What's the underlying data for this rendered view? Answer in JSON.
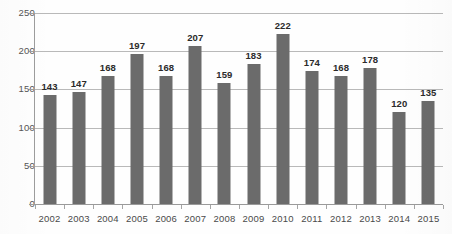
{
  "chart_data": {
    "type": "bar",
    "title": "",
    "xlabel": "",
    "ylabel": "",
    "categories": [
      "2002",
      "2003",
      "2004",
      "2005",
      "2006",
      "2007",
      "2008",
      "2009",
      "2010",
      "2011",
      "2012",
      "2013",
      "2014",
      "2015"
    ],
    "values": [
      143,
      147,
      168,
      197,
      168,
      207,
      159,
      183,
      222,
      174,
      168,
      178,
      120,
      135
    ],
    "data_labels": [
      "143",
      "147",
      "168",
      "197",
      "168",
      "207",
      "159",
      "183",
      "222",
      "174",
      "168",
      "178",
      "120",
      "135"
    ],
    "ylim": [
      0,
      250
    ],
    "ytick_labels": [
      "0",
      "50",
      "100",
      "150",
      "200",
      "250"
    ],
    "ytick_values": [
      0,
      50,
      100,
      150,
      200,
      250
    ],
    "grid": true,
    "legend": false,
    "bar_color": "#6b6b6b",
    "gridline_color": "#b9b9b9",
    "axis_color": "#9a9a9a",
    "label_color": "#2b2b2b"
  }
}
